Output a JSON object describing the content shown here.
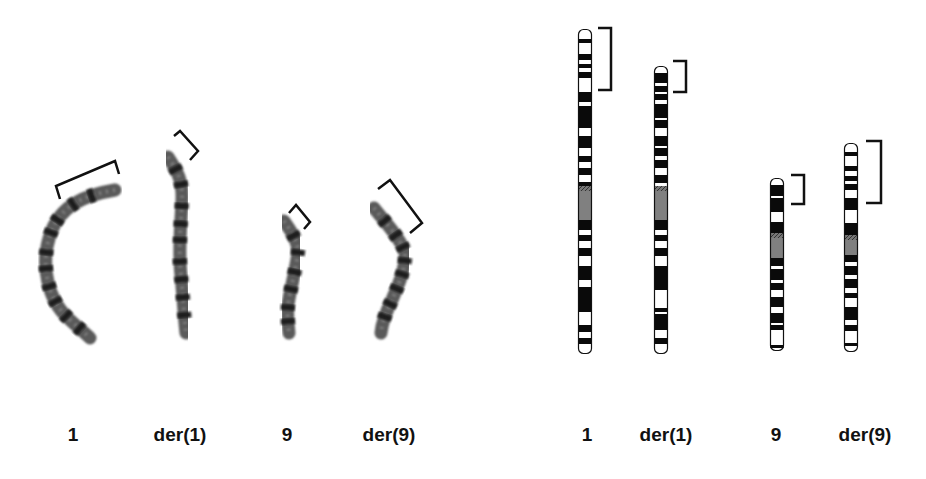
{
  "figure": {
    "panels": [
      {
        "id": "photo-panel",
        "type": "g-banded-metaphase-chromosomes",
        "chromosomes": [
          {
            "label": "1",
            "label_x": 73,
            "path": "M115,190 C85,195 60,205 50,235 C40,265 48,300 68,318 C76,326 84,332 90,338",
            "bands": [
              0.12,
              0.22,
              0.33,
              0.4,
              0.5,
              0.58,
              0.67,
              0.75,
              0.84,
              0.93
            ],
            "bracket": "M60,199 L56,186 L115,161 L119,174"
          },
          {
            "label": "der(1)",
            "label_x": 180,
            "path": "M168,157 C175,168 183,178 182,200 C181,225 178,250 181,275 C183,295 184,315 186,333",
            "bands": [
              0.08,
              0.17,
              0.29,
              0.39,
              0.48,
              0.6,
              0.7,
              0.8,
              0.9
            ],
            "bracket": "M174,136 L180,131 L198,151 L190,160"
          },
          {
            "label": "9",
            "label_x": 287,
            "path": "M284,221 C290,230 298,240 298,252 C296,270 290,290 288,305 C287,315 288,325 289,333",
            "bands": [
              0.15,
              0.3,
              0.47,
              0.62,
              0.78,
              0.9
            ],
            "bracket": "M289,213 L296,205 L310,222 L304,229"
          },
          {
            "label": "der(9)",
            "label_x": 389,
            "path": "M374,208 C385,222 400,238 405,252 C406,270 398,285 392,300 C386,312 382,322 381,333",
            "bands": [
              0.12,
              0.25,
              0.35,
              0.45,
              0.55,
              0.66,
              0.78,
              0.88
            ],
            "bracket": "M378,189 L390,180 L422,223 L410,233"
          }
        ]
      },
      {
        "id": "ideogram-panel",
        "type": "chromosome-ideograms",
        "chromosomes": [
          {
            "label": "1",
            "label_x": 587,
            "x": 578,
            "top": 29,
            "bottom": 354,
            "centromere": [
              186,
              220
            ],
            "dark_bands": [
              [
                39,
                43
              ],
              [
                54,
                60
              ],
              [
                64,
                68
              ],
              [
                72,
                78
              ],
              [
                92,
                102
              ],
              [
                106,
                128
              ],
              [
                136,
                148
              ],
              [
                156,
                162
              ],
              [
                168,
                175
              ],
              [
                182,
                186
              ],
              [
                220,
                230
              ],
              [
                235,
                241
              ],
              [
                248,
                256
              ],
              [
                266,
                280
              ],
              [
                287,
                312
              ],
              [
                325,
                332
              ],
              [
                338,
                344
              ]
            ],
            "bracket": {
              "x": 598,
              "y1": 28,
              "y2": 90,
              "width": 13
            }
          },
          {
            "label": "der(1)",
            "label_x": 666,
            "x": 654,
            "top": 66,
            "bottom": 354,
            "centromere": [
              186,
              220
            ],
            "dark_bands": [
              [
                73,
                83
              ],
              [
                86,
                92
              ],
              [
                94,
                100
              ],
              [
                104,
                118
              ],
              [
                120,
                128
              ],
              [
                136,
                146
              ],
              [
                148,
                156
              ],
              [
                160,
                168
              ],
              [
                175,
                183
              ],
              [
                220,
                230
              ],
              [
                235,
                241
              ],
              [
                248,
                256
              ],
              [
                266,
                290
              ],
              [
                308,
                312
              ],
              [
                314,
                330
              ],
              [
                338,
                344
              ]
            ],
            "bracket": {
              "x": 673,
              "y1": 61,
              "y2": 92,
              "width": 13
            }
          },
          {
            "label": "9",
            "label_x": 776,
            "x": 770,
            "top": 178,
            "bottom": 351,
            "centromere": [
              233,
              258
            ],
            "dark_bands": [
              [
                185,
                196
              ],
              [
                198,
                212
              ],
              [
                222,
                233
              ],
              [
                258,
                266
              ],
              [
                269,
                280
              ],
              [
                283,
                290
              ],
              [
                297,
                307
              ],
              [
                313,
                323
              ],
              [
                325,
                330
              ],
              [
                345,
                348
              ]
            ],
            "bracket": {
              "x": 791,
              "y1": 175,
              "y2": 204,
              "width": 13
            }
          },
          {
            "label": "der(9)",
            "label_x": 865,
            "x": 844,
            "top": 143,
            "bottom": 352,
            "centromere": [
              235,
              255
            ],
            "dark_bands": [
              [
                152,
                156
              ],
              [
                166,
                171
              ],
              [
                176,
                181
              ],
              [
                184,
                190
              ],
              [
                198,
                210
              ],
              [
                223,
                235
              ],
              [
                255,
                262
              ],
              [
                266,
                275
              ],
              [
                279,
                288
              ],
              [
                293,
                298
              ],
              [
                307,
                320
              ],
              [
                325,
                331
              ],
              [
                343,
                346
              ]
            ],
            "bracket": {
              "x": 866,
              "y1": 141,
              "y2": 203,
              "width": 15
            }
          }
        ]
      }
    ],
    "labels": {
      "left": [
        "1",
        "der(1)",
        "9",
        "der(9)"
      ],
      "right": [
        "1",
        "der(1)",
        "9",
        "der(9)"
      ]
    },
    "colors": {
      "band_dark": "#0a0a0a",
      "band_light": "#ffffff",
      "centromere": "#808080",
      "outline": "#111111",
      "bracket": "#111111",
      "photo_chromatin": "#5a5a5a",
      "photo_dark": "#1e1e1e"
    }
  }
}
